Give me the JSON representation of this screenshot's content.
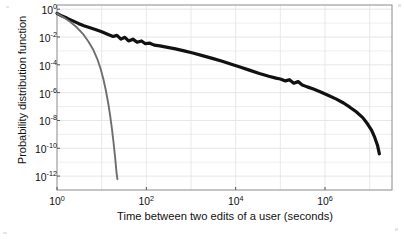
{
  "chart_data": {
    "type": "line",
    "title": "",
    "xlabel": "Time between two edits of a user (seconds)",
    "ylabel": "Probability distribution function",
    "xscale": "log",
    "yscale": "log",
    "xlim": [
      1,
      31622776
    ],
    "ylim": [
      1e-13,
      2
    ],
    "grid": true,
    "legend": "none",
    "xticks": [
      {
        "value": 1,
        "label": "10",
        "exp": "0"
      },
      {
        "value": 100,
        "label": "10",
        "exp": "2"
      },
      {
        "value": 10000,
        "label": "10",
        "exp": "4"
      },
      {
        "value": 1000000,
        "label": "10",
        "exp": "6"
      }
    ],
    "yticks": [
      {
        "value": 1,
        "label": "10",
        "exp": "0"
      },
      {
        "value": 0.01,
        "label": "10",
        "exp": "-2"
      },
      {
        "value": 0.0001,
        "label": "10",
        "exp": "-4"
      },
      {
        "value": 1e-06,
        "label": "10",
        "exp": "-6"
      },
      {
        "value": 1e-08,
        "label": "10",
        "exp": "-8"
      },
      {
        "value": 1e-10,
        "label": "10",
        "exp": "-10"
      },
      {
        "value": 1e-12,
        "label": "10",
        "exp": "-12"
      }
    ],
    "series": [
      {
        "name": "empirical-inter-edit-time-distribution",
        "style": "thick-black-line",
        "color": "#111111",
        "width": 3.2,
        "points": [
          [
            1.0,
            0.5
          ],
          [
            1.3,
            0.32
          ],
          [
            1.7,
            0.22
          ],
          [
            2.2,
            0.15
          ],
          [
            3.0,
            0.095
          ],
          [
            4.0,
            0.065
          ],
          [
            5.5,
            0.046
          ],
          [
            7.5,
            0.033
          ],
          [
            10.0,
            0.024
          ],
          [
            14.0,
            0.015
          ],
          [
            18.0,
            0.011
          ],
          [
            22.0,
            0.013
          ],
          [
            27.0,
            0.007
          ],
          [
            33.0,
            0.0095
          ],
          [
            40.0,
            0.0052
          ],
          [
            50.0,
            0.007
          ],
          [
            62.0,
            0.0042
          ],
          [
            78.0,
            0.0052
          ],
          [
            95.0,
            0.0033
          ],
          [
            120.0,
            0.0036
          ],
          [
            150.0,
            0.0026
          ],
          [
            200.0,
            0.0023
          ],
          [
            300.0,
            0.0018
          ],
          [
            450.0,
            0.0014
          ],
          [
            700.0,
            0.001
          ],
          [
            1100.0,
            0.0007
          ],
          [
            1800.0,
            0.00046
          ],
          [
            3000.0,
            0.00029
          ],
          [
            5000.0,
            0.00018
          ],
          [
            8000.0,
            0.00011
          ],
          [
            13000.0,
            6.6e-05
          ],
          [
            21000.0,
            4e-05
          ],
          [
            34000.0,
            2.4e-05
          ],
          [
            55000.0,
            1.5e-05
          ],
          [
            80000.0,
            1.1e-05
          ],
          [
            100000.0,
            9.5e-06
          ],
          [
            130000.0,
            7e-06
          ],
          [
            160000.0,
            8.5e-06
          ],
          [
            200000.0,
            4.8e-06
          ],
          [
            250000.0,
            6.2e-06
          ],
          [
            310000.0,
            3.6e-06
          ],
          [
            400000.0,
            2.6e-06
          ],
          [
            550000.0,
            1.8e-06
          ],
          [
            800000.0,
            1.1e-06
          ],
          [
            1200000.0,
            6.2e-07
          ],
          [
            1800000.0,
            3.4e-07
          ],
          [
            2600000.0,
            1.8e-07
          ],
          [
            3600000.0,
            9e-08
          ],
          [
            5000000.0,
            4.2e-08
          ],
          [
            7000000.0,
            1.6e-08
          ],
          [
            9000000.0,
            5.5e-09
          ],
          [
            11000000.0,
            2e-09
          ],
          [
            13000000.0,
            6e-10
          ],
          [
            15000000.0,
            1.6e-10
          ],
          [
            16500000.0,
            4e-11
          ]
        ]
      },
      {
        "name": "poisson-exponential-reference",
        "style": "thin-gray-line",
        "color": "#6e6e6e",
        "width": 1.9,
        "points": [
          [
            1.0,
            0.5
          ],
          [
            1.4,
            0.26
          ],
          [
            2.0,
            0.12
          ],
          [
            2.8,
            0.048
          ],
          [
            3.8,
            0.017
          ],
          [
            5.0,
            0.005
          ],
          [
            6.5,
            0.0012
          ],
          [
            8.0,
            0.00026
          ],
          [
            9.5,
            5e-05
          ],
          [
            11.0,
            8.5e-06
          ],
          [
            12.5,
            1.3e-06
          ],
          [
            14.0,
            1.8e-07
          ],
          [
            15.5,
            2.2e-08
          ],
          [
            17.0,
            2.4e-09
          ],
          [
            18.5,
            2.4e-10
          ],
          [
            20.0,
            2.2e-11
          ],
          [
            21.5,
            1.8e-12
          ],
          [
            22.5,
            6e-13
          ]
        ]
      }
    ]
  },
  "axes": {
    "frame_color": "#8a8a8a",
    "grid_color": "#e3e3e3",
    "background": "#ffffff"
  }
}
